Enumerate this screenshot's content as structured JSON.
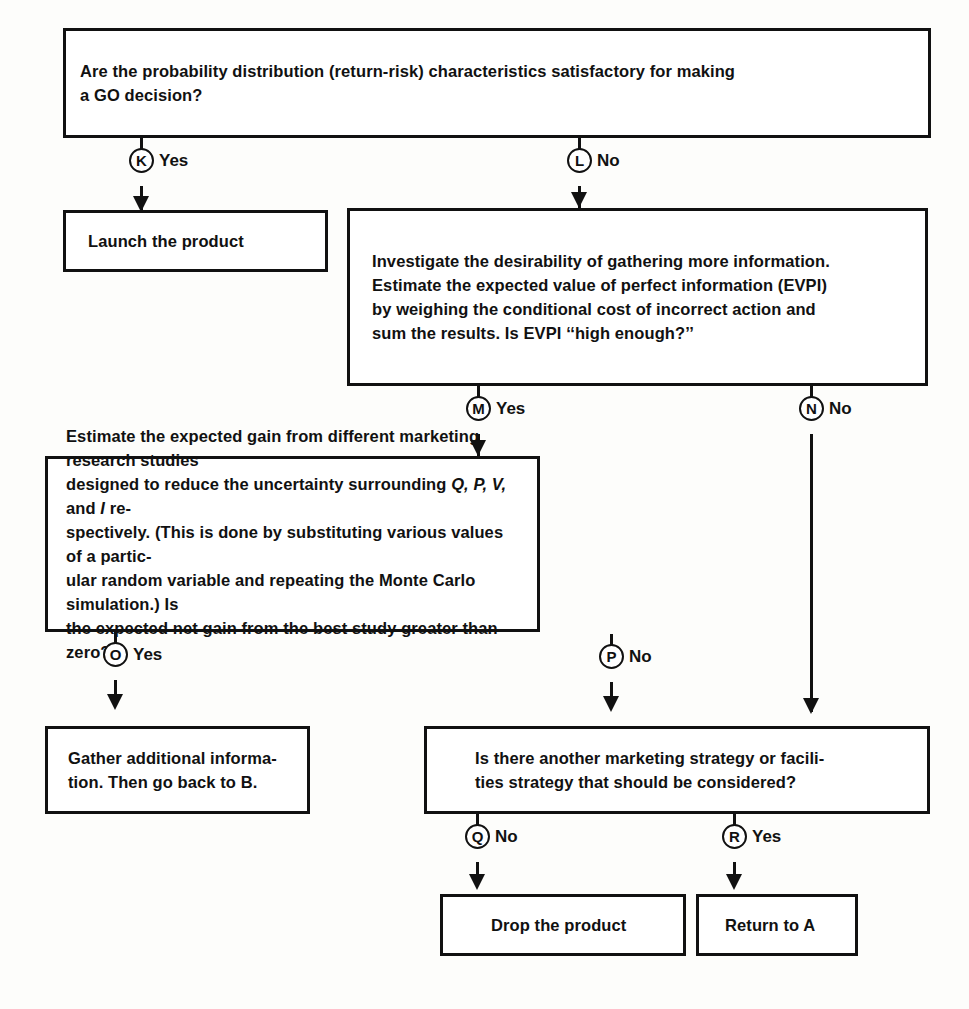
{
  "diagram": {
    "line_color": "#111111",
    "background": "#fdfdfb"
  },
  "boxes": {
    "question_distribution": {
      "id": "box-distribution-question",
      "text": "Are the probability distribution (return-risk) characteristics satisfactory for making\na GO decision?"
    },
    "launch_product": {
      "id": "box-launch-product",
      "text": "Launch the product"
    },
    "investigate_evpi": {
      "id": "box-investigate-evpi",
      "text": "Investigate the desirability of gathering more information.\nEstimate the expected value of perfect information (EVPI)\nby weighing the conditional cost of incorrect action and\nsum the results. Is EVPI ‘‘high enough?’’"
    },
    "estimate_gain": {
      "id": "box-estimate-expected-gain",
      "line1": "Estimate the expected gain from different marketing research studies",
      "line2a": "designed to reduce the uncertainty surrounding ",
      "line2_vars": "Q, P, V,",
      "line2b": " and ",
      "line2_var_i": "I",
      "line2c": " re-",
      "line3": "spectively. (This is done by substituting various values of a partic-",
      "line4": "ular random variable and repeating the Monte Carlo simulation.) Is",
      "line5": "the expected net gain from the best study greater than zero?"
    },
    "gather_info": {
      "id": "box-gather-additional-information",
      "text": "Gather additional informa-\ntion. Then go  back  to B."
    },
    "another_strategy": {
      "id": "box-another-strategy-question",
      "text": "Is there another marketing strategy or facili-\nties strategy that should be considered?"
    },
    "drop_product": {
      "id": "box-drop-product",
      "text": "Drop the product"
    },
    "return_to_a": {
      "id": "box-return-to-a",
      "text": "Return to A"
    }
  },
  "connectors": [
    {
      "key": "K",
      "letter": "K",
      "label": "Yes"
    },
    {
      "key": "L",
      "letter": "L",
      "label": "No"
    },
    {
      "key": "M",
      "letter": "M",
      "label": "Yes"
    },
    {
      "key": "N",
      "letter": "N",
      "label": "No"
    },
    {
      "key": "O",
      "letter": "O",
      "label": "Yes"
    },
    {
      "key": "P",
      "letter": "P",
      "label": "No"
    },
    {
      "key": "Q",
      "letter": "Q",
      "label": "No"
    },
    {
      "key": "R",
      "letter": "R",
      "label": "Yes"
    }
  ]
}
